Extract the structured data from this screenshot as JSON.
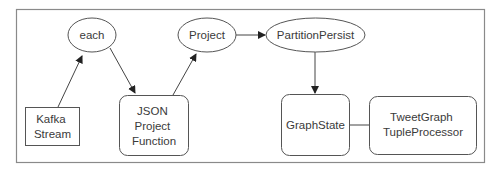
{
  "diagram": {
    "type": "flow",
    "colors": {
      "stroke": "#555555",
      "frame": "#8a8a8a",
      "text": "#3a3a3a",
      "background": "#ffffff"
    },
    "nodes": [
      {
        "id": "each",
        "shape": "ellipse",
        "lines": [
          "each"
        ]
      },
      {
        "id": "kafka",
        "shape": "rect",
        "lines": [
          "Kafka",
          "Stream"
        ]
      },
      {
        "id": "json",
        "shape": "rounded-rect",
        "lines": [
          "JSON",
          "Project",
          "Function"
        ]
      },
      {
        "id": "project",
        "shape": "ellipse",
        "lines": [
          "Project"
        ]
      },
      {
        "id": "partition",
        "shape": "ellipse",
        "lines": [
          "PartitionPersist"
        ]
      },
      {
        "id": "graphstate",
        "shape": "rounded-rect",
        "lines": [
          "GraphState"
        ]
      },
      {
        "id": "tweetgraph",
        "shape": "rounded-rect",
        "lines": [
          "TweetGraph",
          "TupleProcessor"
        ]
      }
    ],
    "edges": [
      {
        "from": "kafka",
        "to": "each",
        "arrow": true
      },
      {
        "from": "each",
        "to": "json",
        "arrow": true
      },
      {
        "from": "json",
        "to": "project",
        "arrow": true
      },
      {
        "from": "project",
        "to": "partition",
        "arrow": true
      },
      {
        "from": "partition",
        "to": "graphstate",
        "arrow": true
      },
      {
        "from": "graphstate",
        "to": "tweetgraph",
        "arrow": false
      }
    ]
  }
}
